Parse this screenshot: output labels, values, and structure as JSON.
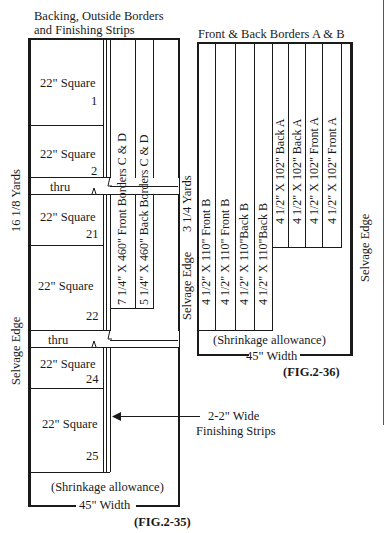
{
  "fig35": {
    "heading_line1": "Backing, Outside Borders",
    "heading_line2": "and Finishing Strips",
    "length_label": "16 1/8 Yards",
    "selvage_label": "Selvage Edge",
    "squares": [
      {
        "label": "22\" Square",
        "number": "1"
      },
      {
        "label": "22\" Square",
        "number": "2"
      },
      {
        "label": "22\" Square",
        "number": "21"
      },
      {
        "label": "22\" Square",
        "number": "22"
      },
      {
        "label": "22\" Square",
        "number": "24"
      },
      {
        "label": "22\" Square",
        "number": "25"
      }
    ],
    "thru_label": "thru",
    "front_border": "7 1/4\" X 460\" Front Borders C & D",
    "back_border": "5 1/4\" X 460\" Back Borders C & D",
    "finishing_strips_line1": "2-2\" Wide",
    "finishing_strips_line2": "Finishing Strips",
    "shrinkage": "(Shrinkage allowance)",
    "width": "45\" Width",
    "caption": "(FIG.2-35)"
  },
  "fig36": {
    "heading": "Front & Back Borders A & B",
    "length_label": "3 1/4 Yards",
    "selvage_left": "Selvage Edge",
    "selvage_right": "Selvage Edge",
    "strips_b": [
      "4 1/2\" X 110\" Front B",
      "4 1/2\" X 110\" Front B",
      "4 1/2\" X 110\"Back B",
      "4 1/2\" X 110\"Back B"
    ],
    "strips_a": [
      "4 1/2\" X 102\" Back A",
      "4 1/2\" X 102\" Back A",
      "4 1/2\" X 102\" Front A",
      "4 1/2\" X 102\" Front A"
    ],
    "shrinkage": "(Shrinkage allowance)",
    "width": "45\" Width",
    "caption": "(FIG.2-36)"
  }
}
